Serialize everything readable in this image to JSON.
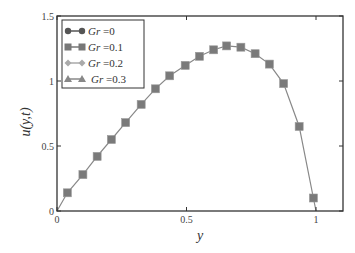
{
  "chart_data": {
    "type": "line",
    "title": "",
    "xlabel": "y",
    "ylabel": "u(y,t)",
    "xlim": [
      0,
      1.1
    ],
    "ylim": [
      0,
      1.5
    ],
    "xticks": [
      "0",
      "0.5",
      "1"
    ],
    "yticks": [
      "0",
      "0.5",
      "1",
      "1.5"
    ],
    "grid": false,
    "legend_position": "upper left",
    "x": [
      0.04,
      0.1,
      0.155,
      0.21,
      0.265,
      0.325,
      0.38,
      0.435,
      0.495,
      0.55,
      0.605,
      0.655,
      0.71,
      0.765,
      0.82,
      0.875,
      0.935,
      0.99
    ],
    "series": [
      {
        "name": "Gr =0",
        "marker": "circle",
        "color": "#555555",
        "values": [
          0.14,
          0.28,
          0.42,
          0.55,
          0.68,
          0.82,
          0.94,
          1.04,
          1.12,
          1.19,
          1.24,
          1.27,
          1.26,
          1.21,
          1.13,
          0.98,
          0.65,
          0.1
        ]
      },
      {
        "name": "Gr =0.1",
        "marker": "square",
        "color": "#777777",
        "values": [
          0.14,
          0.28,
          0.42,
          0.55,
          0.68,
          0.82,
          0.94,
          1.04,
          1.12,
          1.19,
          1.24,
          1.27,
          1.26,
          1.21,
          1.13,
          0.98,
          0.65,
          0.1
        ]
      },
      {
        "name": "Gr =0.2",
        "marker": "diamond",
        "color": "#aaaaaa",
        "values": [
          0.14,
          0.28,
          0.42,
          0.55,
          0.68,
          0.82,
          0.94,
          1.04,
          1.12,
          1.19,
          1.24,
          1.27,
          1.26,
          1.21,
          1.13,
          0.98,
          0.65,
          0.1
        ]
      },
      {
        "name": "Gr =0.3",
        "marker": "triangle",
        "color": "#888888",
        "values": [
          0.14,
          0.28,
          0.42,
          0.55,
          0.68,
          0.82,
          0.94,
          1.04,
          1.12,
          1.19,
          1.24,
          1.27,
          1.26,
          1.21,
          1.13,
          0.98,
          0.65,
          0.1
        ]
      }
    ]
  },
  "legend": [
    {
      "label": "Gr =0"
    },
    {
      "label": "Gr =0.1"
    },
    {
      "label": "Gr =0.2"
    },
    {
      "label": "Gr =0.3"
    }
  ],
  "axes": {
    "xlabel": "y",
    "ylabel": "u(y,t)"
  }
}
